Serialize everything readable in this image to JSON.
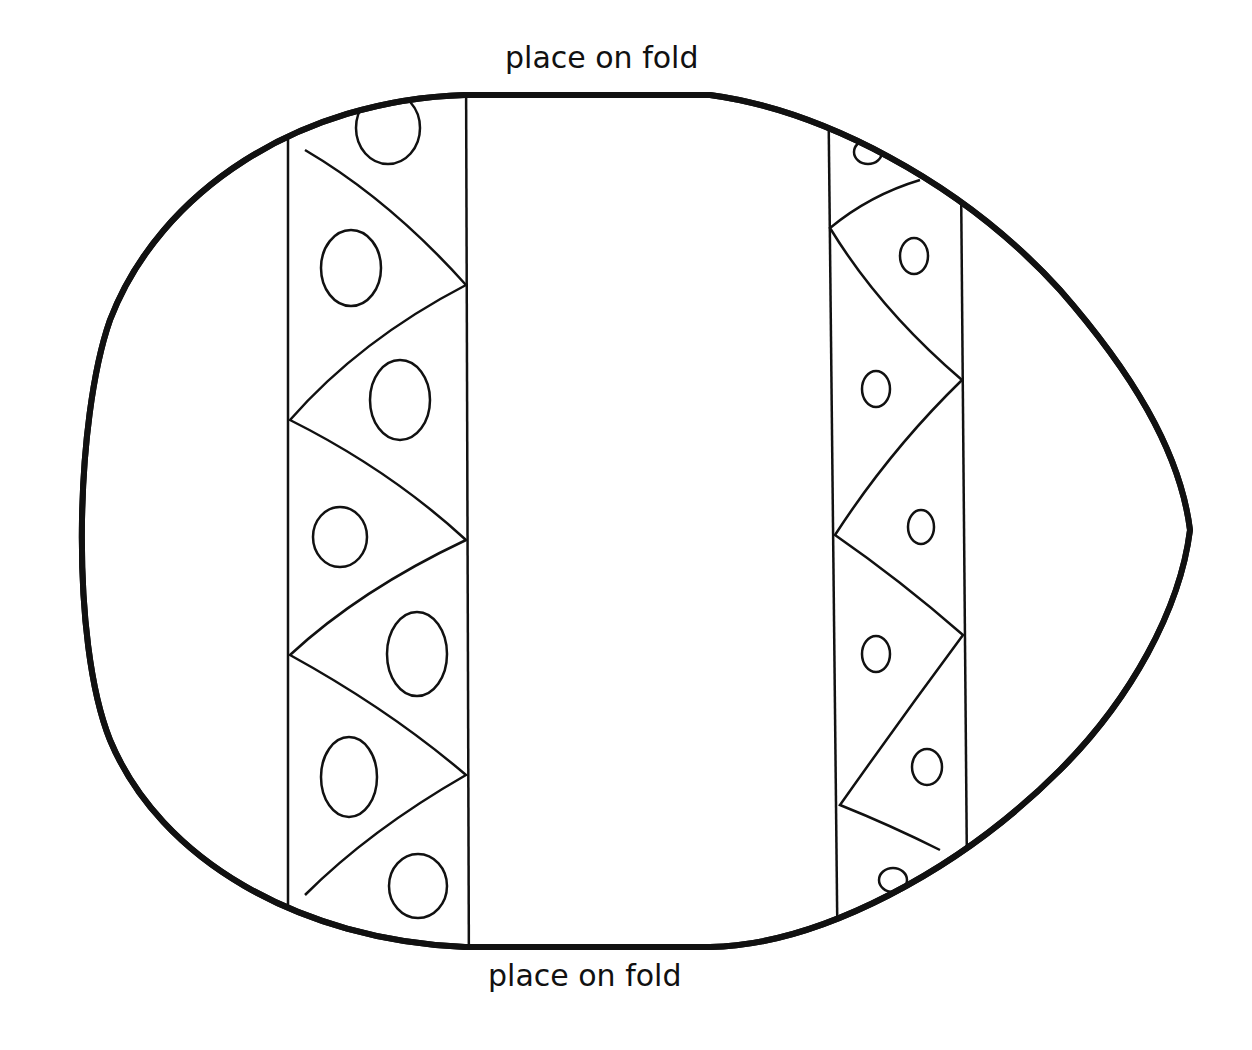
{
  "labels": {
    "top": "place on fold",
    "bottom": "place on fold"
  },
  "colors": {
    "ink": "#111111",
    "paper": "#ffffff"
  },
  "drawing": {
    "subject": "easter egg template outline",
    "bands": [
      {
        "name": "left-band",
        "pattern": "zigzag triangles with ovals"
      },
      {
        "name": "center-panel",
        "pattern": "blank"
      },
      {
        "name": "right-band",
        "pattern": "zigzag triangles with small ovals"
      }
    ]
  }
}
